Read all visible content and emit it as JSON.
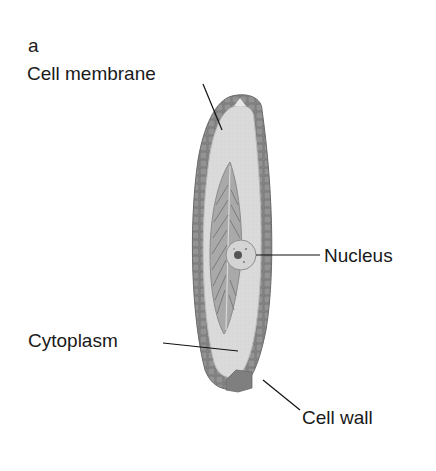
{
  "figure": {
    "panel_label": "a",
    "labels": {
      "cell_membrane": "Cell membrane",
      "nucleus": "Nucleus",
      "cytoplasm": "Cytoplasm",
      "cell_wall": "Cell wall"
    },
    "colors": {
      "cell_wall": "#8c8c8c",
      "cell_wall_segment": "#6f6f6f",
      "cytoplasm": "#d9d9d9",
      "chloroplast": "#a8a8a8",
      "nucleus": "#cfcfcf",
      "nucleolus": "#555555",
      "leader_line": "#111111"
    }
  }
}
